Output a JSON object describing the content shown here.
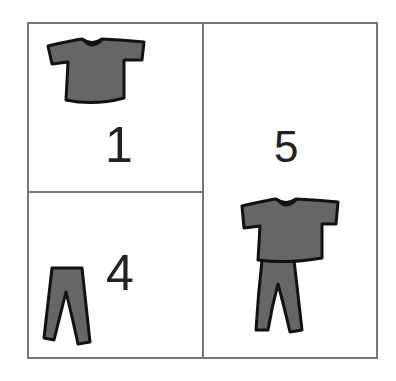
{
  "cells": [
    {
      "id": "shirt",
      "label": "1",
      "item": "shirt-icon"
    },
    {
      "id": "pants",
      "label": "4",
      "item": "pants-icon"
    },
    {
      "id": "outfit",
      "label": "5",
      "item": "outfit-icon"
    }
  ],
  "colors": {
    "border": "#777777",
    "clothing": "#666666",
    "outline": "#111111"
  }
}
